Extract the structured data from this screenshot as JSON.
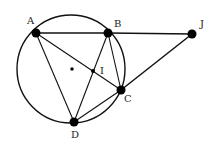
{
  "diagram": {
    "circle": {
      "cx": 71,
      "cy": 69,
      "r": 54
    },
    "center_dot": {
      "x": 72,
      "y": 69
    },
    "points": [
      {
        "id": "A",
        "label": "A",
        "x": 36,
        "y": 33,
        "lx": 27,
        "ly": 24
      },
      {
        "id": "B",
        "label": "B",
        "x": 108,
        "y": 33,
        "lx": 114,
        "ly": 27
      },
      {
        "id": "J",
        "label": "J",
        "x": 192,
        "y": 34,
        "lx": 200,
        "ly": 27
      },
      {
        "id": "C",
        "label": "C",
        "x": 121,
        "y": 90,
        "lx": 124,
        "ly": 102
      },
      {
        "id": "D",
        "label": "D",
        "x": 74,
        "y": 122,
        "lx": 71,
        "ly": 138
      },
      {
        "id": "I",
        "label": "I",
        "x": 93,
        "y": 71,
        "lx": 100,
        "ly": 74
      }
    ],
    "segments": [
      [
        "A",
        "B"
      ],
      [
        "B",
        "J"
      ],
      [
        "J",
        "C"
      ],
      [
        "A",
        "C"
      ],
      [
        "A",
        "D"
      ],
      [
        "B",
        "D"
      ],
      [
        "B",
        "C"
      ],
      [
        "C",
        "D"
      ]
    ]
  }
}
